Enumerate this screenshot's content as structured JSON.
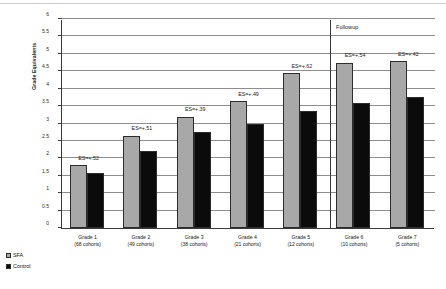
{
  "figure": {
    "legend": [
      {
        "key": "sfa",
        "label": "SFA",
        "color": "#a8a8a8"
      },
      {
        "key": "control",
        "label": "Control",
        "color": "#0b0b0b"
      }
    ],
    "followup_label": "Followup",
    "followup_grades": [
      "Grade 6",
      "Grade 7"
    ]
  },
  "chart_data": {
    "type": "bar",
    "title": "",
    "xlabel": "",
    "ylabel": "Grade Equivalents",
    "ylim": [
      0,
      6
    ],
    "ytick_step": 0.5,
    "yticks": [
      "0",
      "0.5",
      "1",
      "1.5",
      "2",
      "2.5",
      "3",
      "3.5",
      "4",
      "4.5",
      "5",
      "5.5",
      "6"
    ],
    "grid": true,
    "legend_position": "bottom-left",
    "categories": [
      "Grade 1",
      "Grade 2",
      "Grade 3",
      "Grade 4",
      "Grade 5",
      "Grade 6",
      "Grade 7"
    ],
    "category_sublabels": [
      "(68 cohorts)",
      "(49 cohorts)",
      "(38 cohorts)",
      "(21 cohorts)",
      "(12 cohorts)",
      "(10 cohorts)",
      "(5 cohorts)"
    ],
    "series": [
      {
        "name": "SFA",
        "color": "#a8a8a8",
        "values": [
          1.8,
          2.65,
          3.2,
          3.65,
          4.45,
          4.75,
          4.8
        ]
      },
      {
        "name": "Control",
        "color": "#0b0b0b",
        "values": [
          1.58,
          2.2,
          2.75,
          3.0,
          3.35,
          3.6,
          3.75
        ]
      }
    ],
    "annotations": [
      "ES=+.52",
      "ES=+.51",
      "ES=+.39",
      "ES=+.49",
      "ES=+.62",
      "ES=+.54",
      "ES=+.42"
    ]
  }
}
